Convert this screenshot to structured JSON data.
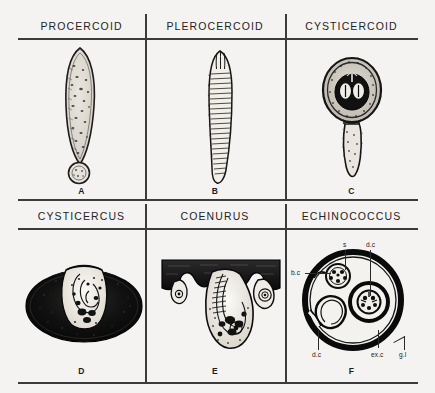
{
  "figure": {
    "title_row_1": [
      "PROCERCOID",
      "PLEROCERCOID",
      "CYSTICERCOID"
    ],
    "title_row_2": [
      "CYSTICERCUS",
      "COENURUS",
      "ECHINOCOCCUS"
    ]
  },
  "columns": {
    "r1c1": {
      "header": "PROCERCOID",
      "letter": "A",
      "figure_name": "procercoid-larva"
    },
    "r1c2": {
      "header": "PLEROCERCOID",
      "letter": "B",
      "figure_name": "plerocercoid-larva"
    },
    "r1c3": {
      "header": "CYSTICERCOID",
      "letter": "C",
      "figure_name": "cysticercoid-larva"
    },
    "r2c1": {
      "header": "CYSTICERCUS",
      "letter": "D",
      "figure_name": "cysticercus-larva"
    },
    "r2c2": {
      "header": "COENURUS",
      "letter": "E",
      "figure_name": "coenurus-larva"
    },
    "r2c3": {
      "header": "ECHINOCOCCUS",
      "letter": "F",
      "figure_name": "echinococcus-hydatid-cyst"
    }
  },
  "annotations": {
    "scolex": "s",
    "daughter_cyst_top": "d.c",
    "brood_capsule": "b.c",
    "daughter_cyst_bottom": "d.c",
    "exogenous_cyst": "ex.c",
    "germinal_layer": "g.l"
  },
  "colors": {
    "background": "#f4f3f1",
    "ink": "#1c1c1c",
    "rule": "#3b3b3b",
    "fill_light": "#ece9e3",
    "fill_dark": "#141414"
  }
}
